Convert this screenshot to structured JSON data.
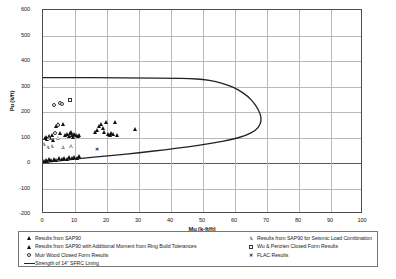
{
  "chart_data": {
    "type": "scatter",
    "title": "",
    "xlabel": "Mu (k-ft/ft)",
    "ylabel": "Pu (k/ft)",
    "xlim": [
      0,
      100
    ],
    "ylim": [
      -200,
      600
    ],
    "xticks": [
      0,
      10,
      20,
      30,
      40,
      50,
      60,
      70,
      80,
      90,
      100
    ],
    "yticks": [
      -200,
      -100,
      0,
      100,
      200,
      300,
      400,
      500,
      600
    ],
    "grid": true,
    "legend_position": "below-axes",
    "series": [
      {
        "name": "Results from SAP90",
        "marker": "triangle-filled",
        "color": "#111111",
        "points": [
          [
            0.8,
            95
          ],
          [
            1.2,
            100
          ],
          [
            1.6,
            92
          ],
          [
            2.0,
            105
          ],
          [
            2.4,
            98
          ],
          [
            3.0,
            110
          ],
          [
            3.4,
            88
          ],
          [
            4.2,
            145
          ],
          [
            5.0,
            152
          ],
          [
            5.6,
            118
          ],
          [
            6.4,
            150
          ],
          [
            7.2,
            108
          ],
          [
            7.8,
            112
          ],
          [
            8.2,
            104
          ],
          [
            8.6,
            116
          ],
          [
            8.9,
            121
          ],
          [
            9.3,
            110
          ],
          [
            9.6,
            100
          ],
          [
            10.0,
            113
          ],
          [
            10.4,
            107
          ],
          [
            11.0,
            103
          ],
          [
            11.6,
            110
          ],
          [
            16.6,
            120
          ],
          [
            17.2,
            128
          ],
          [
            17.8,
            143
          ],
          [
            18.4,
            152
          ],
          [
            18.9,
            136
          ],
          [
            19.4,
            122
          ],
          [
            20.0,
            160
          ],
          [
            20.6,
            112
          ],
          [
            21.0,
            108
          ],
          [
            21.6,
            118
          ],
          [
            22.2,
            112
          ],
          [
            22.8,
            158
          ],
          [
            23.4,
            109
          ],
          [
            29.0,
            134
          ],
          [
            0.6,
            8
          ],
          [
            1.0,
            12
          ],
          [
            1.5,
            6
          ],
          [
            2.2,
            14
          ],
          [
            2.8,
            9
          ],
          [
            3.6,
            16
          ],
          [
            4.4,
            11
          ],
          [
            5.2,
            18
          ],
          [
            6.0,
            13
          ],
          [
            6.8,
            20
          ],
          [
            7.6,
            15
          ],
          [
            8.4,
            22
          ],
          [
            9.2,
            17
          ],
          [
            10.0,
            24
          ],
          [
            10.8,
            19
          ],
          [
            11.4,
            26
          ]
        ]
      },
      {
        "name": "Results from SAP90 with Additional Moment from Ring Build Tolerances",
        "marker": "triangle-filled",
        "color": "#111111",
        "points": []
      },
      {
        "name": "Muir Wood Closed Form Results",
        "marker": "circle-open",
        "color": "#333333",
        "points": [
          [
            3.4,
            228
          ],
          [
            5.2,
            236
          ],
          [
            5.9,
            230
          ],
          [
            4.6,
            148
          ],
          [
            3.8,
            118
          ]
        ]
      },
      {
        "name": "Results from SAP90 for Seismic Load Combination",
        "marker": "triangle-open",
        "color": "#8a8a8a",
        "points": [
          [
            0.4,
            72
          ],
          [
            1.8,
            62
          ],
          [
            3.0,
            64
          ],
          [
            6.4,
            63
          ],
          [
            9.0,
            66
          ],
          [
            2.0,
            96
          ],
          [
            5.0,
            98
          ]
        ]
      },
      {
        "name": "Wu & Penzien Closed Form Results",
        "marker": "square-open",
        "color": "#333333",
        "points": [
          [
            8.4,
            246
          ]
        ]
      },
      {
        "name": "FLAC Results",
        "marker": "x",
        "color": "#111111",
        "points": [
          [
            17.0,
            52
          ]
        ]
      }
    ],
    "capacity_curve": {
      "name": "Strength of 14\" SFRC Lining",
      "color": "#222222",
      "points": [
        [
          0.0,
          335
        ],
        [
          10.0,
          335
        ],
        [
          20.0,
          334
        ],
        [
          30.0,
          333
        ],
        [
          40.0,
          332
        ],
        [
          46.0,
          331
        ],
        [
          50.0,
          328
        ],
        [
          54.0,
          320
        ],
        [
          58.0,
          305
        ],
        [
          61.0,
          288
        ],
        [
          64.0,
          262
        ],
        [
          66.0,
          235
        ],
        [
          67.5,
          205
        ],
        [
          68.2,
          178
        ],
        [
          68.0,
          152
        ],
        [
          66.5,
          128
        ],
        [
          63.5,
          108
        ],
        [
          59.0,
          92
        ],
        [
          53.0,
          78
        ],
        [
          46.0,
          65
        ],
        [
          38.0,
          52
        ],
        [
          30.0,
          40
        ],
        [
          22.0,
          30
        ],
        [
          15.0,
          22
        ],
        [
          9.0,
          14
        ],
        [
          4.0,
          7
        ],
        [
          0.0,
          2
        ]
      ]
    }
  },
  "legend": {
    "left_items": [
      {
        "symbol": "triangle-filled",
        "label": "Results from SAP90"
      },
      {
        "symbol": "triangle-filled",
        "label": "Results from SAP90 with Additional Moment from Ring Build Tolerances"
      },
      {
        "symbol": "circle-open",
        "label": "Muir Wood Closed Form Results"
      },
      {
        "symbol": "line",
        "label": "Strength of 14\" SFRC Lining"
      }
    ],
    "right_items": [
      {
        "symbol": "triangle-open",
        "label": "Results from SAP90 for Seismic Load Combination"
      },
      {
        "symbol": "square-open",
        "label": "Wu & Penzien Closed Form Results"
      },
      {
        "symbol": "x",
        "label": "FLAC Results"
      }
    ]
  }
}
